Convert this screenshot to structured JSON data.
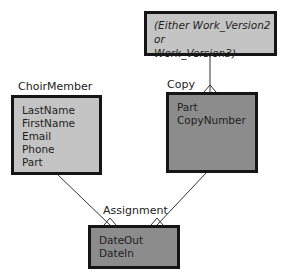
{
  "diagram": {
    "type": "entity-relationship",
    "colors": {
      "light_fill": "#c4c4c4",
      "dark_fill": "#8c8c8c",
      "border": "#151515",
      "line": "#333333"
    },
    "entities": {
      "work_version": {
        "note_line1": "(Either Work_Version2 or",
        "note_line2": "Work_Version3)"
      },
      "choir_member": {
        "name": "ChoirMember",
        "attributes": [
          "LastName",
          "FirstName",
          "Email",
          "Phone",
          "Part"
        ]
      },
      "copy": {
        "name": "Copy",
        "attributes": [
          "Part",
          "CopyNumber"
        ]
      },
      "assignment": {
        "name": "Assignment",
        "attributes": [
          "DateOut",
          "DateIn"
        ]
      }
    },
    "relationships": [
      {
        "from": "work_version",
        "to": "copy",
        "to_cardinality": "many"
      },
      {
        "from": "choir_member",
        "to": "assignment",
        "to_cardinality": "many"
      },
      {
        "from": "copy",
        "to": "assignment",
        "to_cardinality": "many"
      }
    ]
  }
}
